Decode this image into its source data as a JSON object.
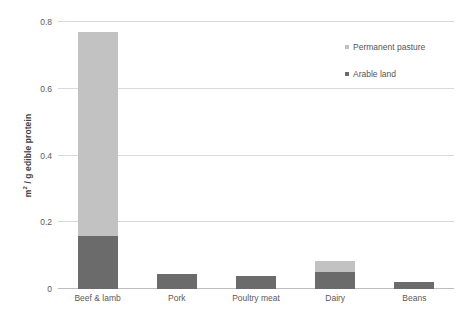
{
  "chart_data": {
    "type": "bar",
    "subtype": "stacked-bar",
    "title": "",
    "xlabel": "",
    "ylabel": "m² / g edible protein",
    "ylabel_parts": {
      "prefix": "m",
      "sup": "2",
      "suffix": " / g edible protein"
    },
    "categories": [
      "Beef & lamb",
      "Pork",
      "Poultry meat",
      "Dairy",
      "Beans"
    ],
    "series": [
      {
        "name": "Arable land",
        "color": "#6b6b6b",
        "values": [
          0.16,
          0.045,
          0.04,
          0.051,
          0.02
        ]
      },
      {
        "name": "Permanent pasture",
        "color": "#c2c2c2",
        "values": [
          0.61,
          0.0,
          0.0,
          0.033,
          0.0
        ]
      }
    ],
    "totals": [
      0.77,
      0.045,
      0.04,
      0.084,
      0.02
    ],
    "ylim": [
      0,
      0.8
    ],
    "yticks": [
      0,
      0.2,
      0.4,
      0.6,
      0.8
    ],
    "ytick_labels": [
      "0",
      "0.2",
      "0.4",
      "0.6",
      "0.8"
    ],
    "grid": true,
    "grid_axis": "y",
    "legend_position": "top-right",
    "legend": [
      {
        "label": "Permanent pasture",
        "color": "#c2c2c2"
      },
      {
        "label": "Arable land",
        "color": "#6b6b6b"
      }
    ]
  },
  "colors": {
    "arable_land": "#6b6b6b",
    "permanent_pasture": "#c2c2c2",
    "gridline": "#d9d9d9",
    "baseline": "#bdbdbd",
    "text": "#555555",
    "background": "#ffffff"
  }
}
